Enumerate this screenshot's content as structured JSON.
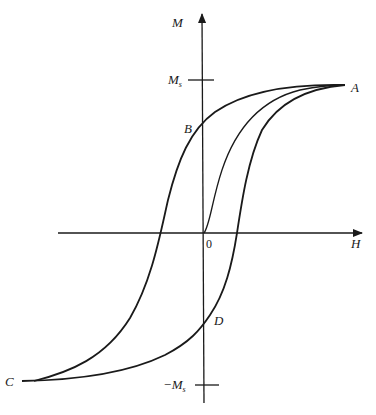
{
  "diagram": {
    "type": "magnetic hysteresis loop",
    "axes": {
      "x_label": "H",
      "y_label": "M",
      "origin_label": "0"
    },
    "ticks": {
      "saturation_pos": "M",
      "saturation_pos_sub": "s",
      "saturation_neg": "−M",
      "saturation_neg_sub": "s"
    },
    "points": {
      "A": "A",
      "B": "B",
      "C": "C",
      "D": "D"
    },
    "curves": [
      {
        "name": "initial magnetization curve",
        "from": "0",
        "to": "A"
      },
      {
        "name": "descending branch",
        "from": "A",
        "through": "B",
        "to": "C"
      },
      {
        "name": "ascending branch",
        "from": "C",
        "through": "D",
        "to": "A"
      }
    ],
    "colors": {
      "line": "#1a1a1a",
      "background": "#ffffff"
    }
  }
}
